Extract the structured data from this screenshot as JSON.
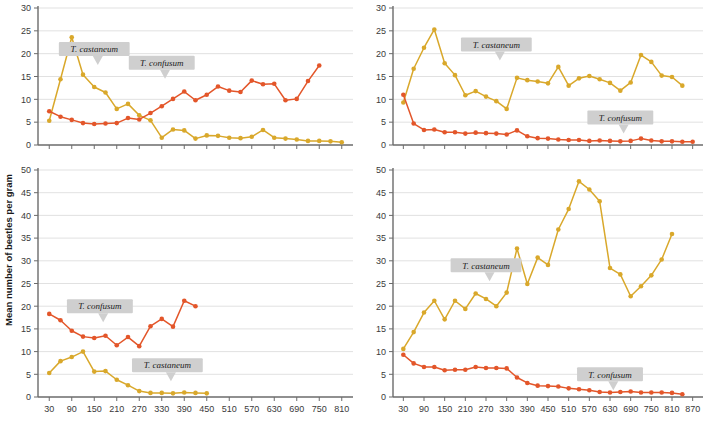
{
  "figure": {
    "ylabel": "Mean number of beetles per gram",
    "colors": {
      "castaneum": "#D9A82B",
      "confusum": "#E3562A",
      "grid": "#d9d9d9",
      "axis": "#6b6b6b",
      "callout": "#cfcfcf"
    },
    "series_names": {
      "castaneum": "T. castaneum",
      "confusum": "T. confusum"
    }
  },
  "chart_data": [
    {
      "type": "line",
      "panel": "top-left",
      "title": "",
      "xlabel": "",
      "ylabel": "Mean number of beetles per gram",
      "ylim": [
        0,
        30
      ],
      "yticks": [
        0,
        5,
        10,
        15,
        20,
        25,
        30
      ],
      "xlim": [
        0,
        840
      ],
      "xticks": [
        30,
        90,
        150,
        210,
        270,
        330,
        390,
        450,
        510,
        570,
        630,
        690,
        750,
        810
      ],
      "xticklabels": [],
      "grid": true,
      "legend": "inline-callouts",
      "annotations": [
        {
          "text": "T. castaneum",
          "series": "castaneum",
          "x": 150,
          "y": 21
        },
        {
          "text": "T. confusum",
          "series": "confusum",
          "x": 330,
          "y": 18
        }
      ],
      "series": [
        {
          "name": "T. castaneum",
          "color": "#D9A82B",
          "x": [
            30,
            60,
            90,
            120,
            150,
            180,
            210,
            240,
            270,
            300,
            330,
            360,
            390,
            420,
            450,
            480,
            510,
            540,
            570,
            600,
            630,
            660,
            690,
            720,
            750,
            780,
            810
          ],
          "values": [
            5.3,
            14.4,
            23.6,
            15.4,
            12.7,
            11.5,
            7.9,
            9.0,
            6.5,
            5.4,
            1.6,
            3.4,
            3.2,
            1.4,
            2.1,
            2.0,
            1.6,
            1.5,
            1.8,
            3.3,
            1.6,
            1.4,
            1.2,
            0.9,
            0.9,
            0.8,
            0.6
          ]
        },
        {
          "name": "T. confusum",
          "color": "#E3562A",
          "x": [
            30,
            60,
            90,
            120,
            150,
            180,
            210,
            240,
            270,
            300,
            330,
            360,
            390,
            420,
            450,
            480,
            510,
            540,
            570,
            600,
            630,
            660,
            690,
            720,
            750
          ],
          "values": [
            7.4,
            6.2,
            5.5,
            4.8,
            4.6,
            4.7,
            4.8,
            5.9,
            5.6,
            7.0,
            8.5,
            10.1,
            11.7,
            9.8,
            11.0,
            12.8,
            11.9,
            11.6,
            14.1,
            13.3,
            13.4,
            9.8,
            10.1,
            14.0,
            17.4
          ]
        }
      ]
    },
    {
      "type": "line",
      "panel": "top-right",
      "title": "",
      "xlabel": "",
      "ylabel": "",
      "ylim": [
        0,
        30
      ],
      "yticks": [
        0,
        5,
        10,
        15,
        20,
        25,
        30
      ],
      "xlim": [
        0,
        900
      ],
      "xticks": [
        30,
        90,
        150,
        210,
        270,
        330,
        390,
        450,
        510,
        570,
        630,
        690,
        750,
        810,
        870
      ],
      "xticklabels": [],
      "grid": true,
      "legend": "inline-callouts",
      "annotations": [
        {
          "text": "T. castaneum",
          "series": "castaneum",
          "x": 300,
          "y": 22
        },
        {
          "text": "T. confusum",
          "series": "confusum",
          "x": 660,
          "y": 6
        }
      ],
      "series": [
        {
          "name": "T. castaneum",
          "color": "#D9A82B",
          "x": [
            30,
            60,
            90,
            120,
            150,
            180,
            210,
            240,
            270,
            300,
            330,
            360,
            390,
            420,
            450,
            480,
            510,
            540,
            570,
            600,
            630,
            660,
            690,
            720,
            750,
            780,
            810,
            840
          ],
          "values": [
            9.3,
            16.7,
            21.3,
            25.3,
            17.9,
            15.3,
            10.9,
            11.8,
            10.6,
            9.6,
            7.9,
            14.7,
            14.2,
            13.9,
            13.5,
            17.1,
            13.0,
            14.6,
            15.1,
            14.4,
            13.6,
            11.9,
            13.7,
            19.7,
            18.2,
            15.2,
            14.9,
            13.0
          ]
        },
        {
          "name": "T. confusum",
          "color": "#E3562A",
          "x": [
            30,
            60,
            90,
            120,
            150,
            180,
            210,
            240,
            270,
            300,
            330,
            360,
            390,
            420,
            450,
            480,
            510,
            540,
            570,
            600,
            630,
            660,
            690,
            720,
            750,
            780,
            810,
            840,
            870
          ],
          "values": [
            11.0,
            4.7,
            3.3,
            3.4,
            2.8,
            2.8,
            2.5,
            2.7,
            2.6,
            2.5,
            2.3,
            3.2,
            1.9,
            1.5,
            1.4,
            1.2,
            1.1,
            1.1,
            0.9,
            1.0,
            0.9,
            0.8,
            0.9,
            1.4,
            1.0,
            0.8,
            0.8,
            0.7,
            0.7
          ]
        }
      ]
    },
    {
      "type": "line",
      "panel": "bottom-left",
      "title": "",
      "xlabel": "",
      "ylabel": "Mean number of beetles per gram",
      "ylim": [
        0,
        50
      ],
      "yticks": [
        0,
        5,
        10,
        15,
        20,
        25,
        30,
        35,
        40,
        45,
        50
      ],
      "xlim": [
        0,
        840
      ],
      "xticks": [
        30,
        90,
        150,
        210,
        270,
        330,
        390,
        450,
        510,
        570,
        630,
        690,
        750,
        810
      ],
      "xticklabels": [
        "30",
        "90",
        "150",
        "210",
        "270",
        "330",
        "390",
        "450",
        "510",
        "570",
        "630",
        "690",
        "750",
        "810"
      ],
      "grid": true,
      "legend": "inline-callouts",
      "annotations": [
        {
          "text": "T. confusum",
          "series": "confusum",
          "x": 165,
          "y": 20
        },
        {
          "text": "T. castaneum",
          "series": "castaneum",
          "x": 345,
          "y": 7
        }
      ],
      "series": [
        {
          "name": "T. confusum",
          "color": "#E3562A",
          "x": [
            30,
            60,
            90,
            120,
            150,
            180,
            210,
            240,
            270,
            300,
            330,
            360,
            390,
            420
          ],
          "values": [
            18.3,
            16.9,
            14.6,
            13.3,
            13.0,
            13.5,
            11.4,
            13.2,
            11.2,
            15.6,
            17.2,
            15.5,
            21.2,
            20.0
          ]
        },
        {
          "name": "T. castaneum",
          "color": "#D9A82B",
          "x": [
            30,
            60,
            90,
            120,
            150,
            180,
            210,
            240,
            270,
            300,
            330,
            360,
            390,
            420,
            450
          ],
          "values": [
            5.3,
            7.9,
            8.8,
            10.0,
            5.6,
            5.7,
            3.8,
            2.6,
            1.3,
            0.9,
            0.9,
            0.8,
            1.0,
            0.9,
            0.8
          ]
        }
      ]
    },
    {
      "type": "line",
      "panel": "bottom-right",
      "title": "",
      "xlabel": "",
      "ylabel": "",
      "ylim": [
        0,
        50
      ],
      "yticks": [
        0,
        5,
        10,
        15,
        20,
        25,
        30,
        35,
        40,
        45,
        50
      ],
      "xlim": [
        0,
        900
      ],
      "xticks": [
        30,
        90,
        150,
        210,
        270,
        330,
        390,
        450,
        510,
        570,
        630,
        690,
        750,
        810,
        870
      ],
      "xticklabels": [
        "30",
        "90",
        "150",
        "210",
        "270",
        "330",
        "390",
        "450",
        "510",
        "570",
        "630",
        "690",
        "750",
        "810",
        "870"
      ],
      "grid": true,
      "legend": "inline-callouts",
      "annotations": [
        {
          "text": "T. castaneum",
          "series": "castaneum",
          "x": 270,
          "y": 29
        },
        {
          "text": "T. confusum",
          "series": "confusum",
          "x": 630,
          "y": 5
        }
      ],
      "series": [
        {
          "name": "T. castaneum",
          "color": "#D9A82B",
          "x": [
            30,
            60,
            90,
            120,
            150,
            180,
            210,
            240,
            270,
            300,
            330,
            360,
            390,
            420,
            450,
            480,
            510,
            540,
            570,
            600,
            630,
            660,
            690,
            720,
            750,
            780,
            810
          ],
          "values": [
            10.6,
            14.3,
            18.6,
            21.2,
            17.1,
            21.2,
            19.4,
            22.8,
            21.6,
            20.0,
            23.0,
            32.7,
            24.9,
            30.7,
            29.1,
            36.9,
            41.4,
            47.5,
            45.7,
            43.1,
            28.4,
            27.0,
            22.2,
            24.4,
            26.8,
            30.3,
            35.9
          ]
        },
        {
          "name": "T. confusum",
          "color": "#E3562A",
          "x": [
            30,
            60,
            90,
            120,
            150,
            180,
            210,
            240,
            270,
            300,
            330,
            360,
            390,
            420,
            450,
            480,
            510,
            540,
            570,
            600,
            630,
            660,
            690,
            720,
            750,
            780,
            810,
            840
          ],
          "values": [
            9.3,
            7.4,
            6.6,
            6.6,
            5.9,
            6.0,
            6.0,
            6.6,
            6.4,
            6.4,
            6.3,
            4.3,
            3.1,
            2.5,
            2.4,
            2.3,
            1.9,
            1.7,
            1.5,
            1.1,
            1.0,
            1.1,
            1.2,
            1.0,
            1.0,
            1.0,
            0.9,
            0.6
          ]
        }
      ]
    }
  ]
}
